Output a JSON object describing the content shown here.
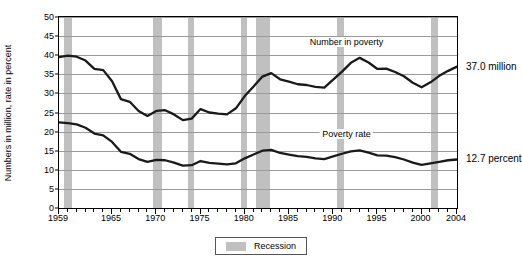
{
  "chart_data": {
    "type": "line",
    "title": "",
    "xlabel": "",
    "ylabel": "Numbers in million, rate in percent",
    "xlim": [
      1959,
      2004
    ],
    "ylim": [
      0,
      50
    ],
    "grid": true,
    "legend_position": "bottom-center",
    "ytick_labels": [
      "0",
      "5",
      "10",
      "15",
      "20",
      "25",
      "30",
      "35",
      "40",
      "45",
      "50"
    ],
    "ytick_values": [
      0,
      5,
      10,
      15,
      20,
      25,
      30,
      35,
      40,
      45,
      50
    ],
    "xtick_labels": [
      "1959",
      "1965",
      "1970",
      "1975",
      "1980",
      "1985",
      "1990",
      "1995",
      "2000",
      "2004"
    ],
    "xtick_values": [
      1959,
      1965,
      1970,
      1975,
      1980,
      1985,
      1990,
      1995,
      2000,
      2004
    ],
    "x": [
      1959,
      1960,
      1961,
      1962,
      1963,
      1964,
      1965,
      1966,
      1967,
      1968,
      1969,
      1970,
      1971,
      1972,
      1973,
      1974,
      1975,
      1976,
      1977,
      1978,
      1979,
      1980,
      1981,
      1982,
      1983,
      1984,
      1985,
      1986,
      1987,
      1988,
      1989,
      1990,
      1991,
      1992,
      1993,
      1994,
      1995,
      1996,
      1997,
      1998,
      1999,
      2000,
      2001,
      2002,
      2003,
      2004
    ],
    "series": [
      {
        "name": "Number in poverty",
        "unit": "million",
        "annotation": "Number in poverty",
        "end_label": "37.0 million",
        "end_value": 37.0,
        "values": [
          39.5,
          39.9,
          39.6,
          38.6,
          36.4,
          36.1,
          33.2,
          28.5,
          27.8,
          25.4,
          24.1,
          25.4,
          25.6,
          24.5,
          23.0,
          23.4,
          25.9,
          25.0,
          24.7,
          24.5,
          26.1,
          29.3,
          31.8,
          34.4,
          35.3,
          33.7,
          33.1,
          32.4,
          32.2,
          31.7,
          31.5,
          33.6,
          35.7,
          38.0,
          39.3,
          38.1,
          36.4,
          36.5,
          35.6,
          34.5,
          32.8,
          31.6,
          32.9,
          34.6,
          35.9,
          37.0
        ]
      },
      {
        "name": "Poverty rate",
        "unit": "percent",
        "annotation": "Poverty rate",
        "end_label": "12.7 percent",
        "end_value": 12.7,
        "values": [
          22.4,
          22.2,
          21.9,
          21.0,
          19.5,
          19.0,
          17.3,
          14.7,
          14.2,
          12.8,
          12.1,
          12.6,
          12.5,
          11.9,
          11.1,
          11.2,
          12.3,
          11.8,
          11.6,
          11.4,
          11.7,
          13.0,
          14.0,
          15.0,
          15.2,
          14.4,
          14.0,
          13.6,
          13.4,
          13.0,
          12.8,
          13.5,
          14.2,
          14.8,
          15.1,
          14.5,
          13.8,
          13.7,
          13.3,
          12.7,
          11.9,
          11.3,
          11.7,
          12.1,
          12.5,
          12.7
        ]
      }
    ],
    "shaded_regions": {
      "label": "Recession",
      "color": "#c0c0c0",
      "periods": [
        {
          "start": 1959.6,
          "end": 1960.5
        },
        {
          "start": 1969.6,
          "end": 1970.6
        },
        {
          "start": 1973.6,
          "end": 1974.3
        },
        {
          "start": 1979.6,
          "end": 1980.3
        },
        {
          "start": 1981.3,
          "end": 1982.9
        },
        {
          "start": 1990.4,
          "end": 1991.2
        },
        {
          "start": 2001.1,
          "end": 2001.8
        }
      ]
    }
  },
  "legend": {
    "recession_label": "Recession"
  }
}
